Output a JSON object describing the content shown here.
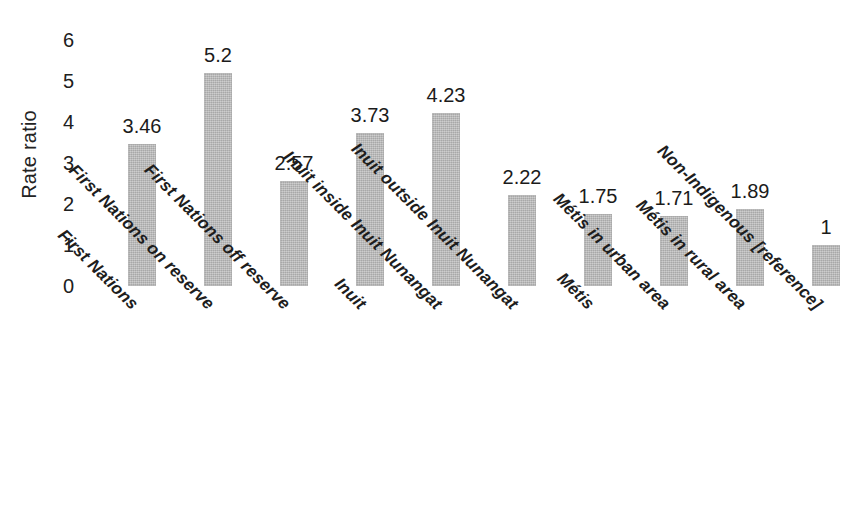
{
  "chart_data": {
    "type": "bar",
    "title": "",
    "subtitle": "",
    "xlabel": "",
    "ylabel": "Rate ratio",
    "ylim": [
      0,
      6
    ],
    "yticks": [
      0,
      1,
      2,
      3,
      4,
      5,
      6
    ],
    "ytick_labels": [
      "0",
      "1",
      "2",
      "3",
      "4",
      "5",
      "6"
    ],
    "grid": false,
    "legend": false,
    "legend_position": "none",
    "bar_color": "#bcbcbc",
    "text_color": "#1b1b1b",
    "categories": [
      "First Nations",
      "First Nations on reserve",
      "First Nations off reserve",
      "Inuit",
      "Inuit inside Inuit Nunangat",
      "Inuit outside Inuit Nunangat",
      "Métis",
      "Métis in urban area",
      "Métis in rural area",
      "Non-Indigenous [reference]"
    ],
    "values": [
      3.46,
      5.2,
      2.57,
      3.73,
      4.23,
      2.22,
      1.75,
      1.71,
      1.89,
      1
    ],
    "value_labels": [
      "3.46",
      "5.2",
      "2.57",
      "3.73",
      "4.23",
      "2.22",
      "1.75",
      "1.71",
      "1.89",
      "1"
    ],
    "bars": [
      {
        "category": "First Nations",
        "value": 3.46,
        "label": "3.46"
      },
      {
        "category": "First Nations on reserve",
        "value": 5.2,
        "label": "5.2"
      },
      {
        "category": "First Nations off reserve",
        "value": 2.57,
        "label": "2.57"
      },
      {
        "category": "Inuit",
        "value": 3.73,
        "label": "3.73"
      },
      {
        "category": "Inuit inside Inuit Nunangat",
        "value": 4.23,
        "label": "4.23"
      },
      {
        "category": "Inuit outside Inuit Nunangat",
        "value": 2.22,
        "label": "2.22"
      },
      {
        "category": "Métis",
        "value": 1.75,
        "label": "1.75"
      },
      {
        "category": "Métis in urban area",
        "value": 1.71,
        "label": "1.71"
      },
      {
        "category": "Métis in rural area",
        "value": 1.89,
        "label": "1.89"
      },
      {
        "category": "Non-Indigenous [reference]",
        "value": 1,
        "label": "1"
      }
    ]
  }
}
